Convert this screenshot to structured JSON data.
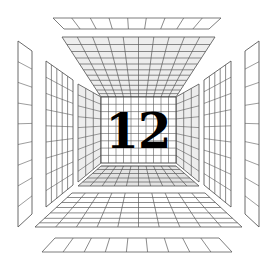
{
  "scene": {
    "title": "One-Point Perspective Grid Room",
    "description": "Wireframe perspective tunnel of grid panels with numeral on back wall",
    "canvas": {
      "width": 274,
      "height": 267
    },
    "background_color": "#ffffff",
    "line_color": "#5a5a5a",
    "line_color_light": "#8e8e8e",
    "line_color_dark": "#3a3a3a",
    "numeral_color": "#000000"
  },
  "back_wall": {
    "label": "back-wall-grid",
    "numeral": "12",
    "columns": 10,
    "rows": 9,
    "rect": {
      "x": 101,
      "y": 97,
      "width": 75,
      "height": 66
    }
  },
  "vanishing_point": {
    "x": 138,
    "y": 130
  },
  "ceiling": {
    "label": "ceiling-grid",
    "columns": 10,
    "rows": 9,
    "shaded": true
  },
  "floor": {
    "label": "floor-grid",
    "back_section_columns": 10,
    "back_section_rows": 4,
    "front_section_columns": 10,
    "front_section_rows": 7,
    "shaded": true
  },
  "left_wall": {
    "label": "left-wall",
    "panels": [
      {
        "name": "left-panel-inner",
        "columns": 3,
        "rows": 9
      },
      {
        "name": "left-panel-middle",
        "columns": 5,
        "rows": 9
      },
      {
        "name": "left-panel-outer",
        "columns": 1,
        "rows": 9
      }
    ]
  },
  "right_wall": {
    "label": "right-wall",
    "panels": [
      {
        "name": "right-panel-inner",
        "columns": 3,
        "rows": 9
      },
      {
        "name": "right-panel-middle",
        "columns": 5,
        "rows": 9
      },
      {
        "name": "right-panel-outer",
        "columns": 1,
        "rows": 9
      }
    ]
  },
  "top_strip": {
    "label": "detached-top-strip",
    "divisions": 9,
    "rows": 1
  },
  "bottom_strip": {
    "label": "detached-bottom-strip",
    "divisions": 9,
    "rows": 1
  }
}
